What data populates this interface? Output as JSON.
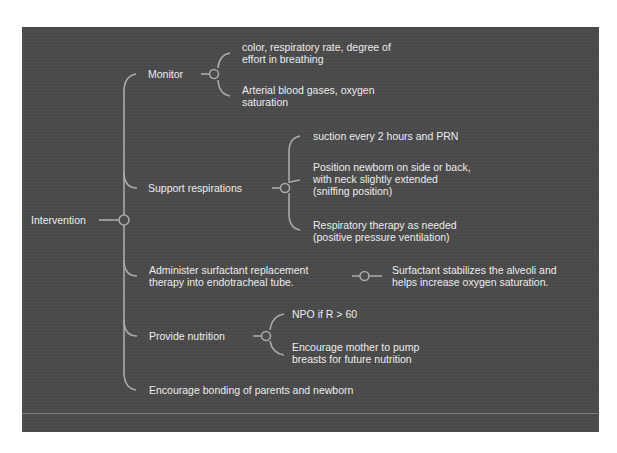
{
  "diagram": {
    "type": "mind-map",
    "colors": {
      "background": "#4b4b4b",
      "text": "#ececec",
      "connector": "#a9a9a9",
      "page": "#ffffff"
    },
    "root": {
      "label": "Intervention"
    },
    "branches": [
      {
        "label": "Monitor",
        "children": [
          {
            "lines": [
              "color, respiratory rate, degree of",
              "effort in breathing"
            ]
          },
          {
            "lines": [
              "Arterial blood gases, oxygen",
              "saturation"
            ]
          }
        ]
      },
      {
        "label": "Support respirations",
        "children": [
          {
            "lines": [
              "suction every 2 hours and PRN"
            ]
          },
          {
            "lines": [
              "Position newborn on side or back,",
              "with neck slightly extended",
              "(sniffing position)"
            ]
          },
          {
            "lines": [
              "Respiratory therapy as needed",
              "(positive pressure ventilation)"
            ]
          }
        ]
      },
      {
        "lines": [
          "Administer surfactant replacement",
          "therapy into endotracheal tube."
        ],
        "children": [
          {
            "lines": [
              "Surfactant stabilizes the alveoli and",
              "helps increase oxygen saturation."
            ]
          }
        ]
      },
      {
        "label": "Provide nutrition",
        "children": [
          {
            "lines": [
              "NPO if R > 60"
            ]
          },
          {
            "lines": [
              "Encourage mother to pump",
              "breasts for future nutrition"
            ]
          }
        ]
      },
      {
        "label": "Encourage bonding of parents and newborn",
        "children": []
      }
    ]
  }
}
